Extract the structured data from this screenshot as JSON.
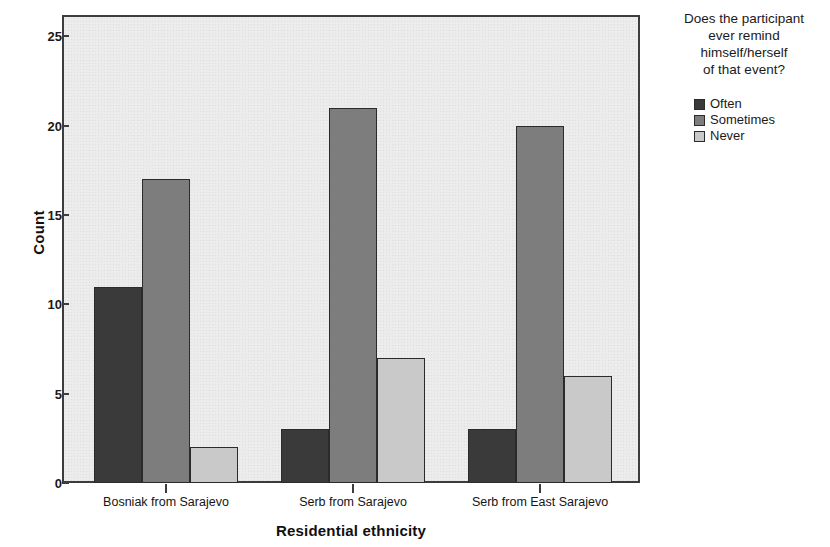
{
  "chart_data": {
    "type": "bar",
    "title": "",
    "xlabel": "Residential ethnicity",
    "ylabel": "Count",
    "categories": [
      "Bosniak from Sarajevo",
      "Serb from Sarajevo",
      "Serb from East Sarajevo"
    ],
    "series": [
      {
        "name": "Often",
        "color": "#3a3a3a",
        "values": [
          11,
          3,
          3
        ]
      },
      {
        "name": "Sometimes",
        "color": "#7d7d7d",
        "values": [
          17,
          21,
          20
        ]
      },
      {
        "name": "Never",
        "color": "#c9c9c9",
        "values": [
          2,
          7,
          6
        ]
      }
    ],
    "ylim": [
      0,
      26.2
    ],
    "yticks": [
      0,
      5,
      10,
      15,
      20,
      25
    ],
    "ytick_labels": [
      "0",
      "5",
      "10",
      "15",
      "20",
      "25"
    ],
    "grid": false,
    "legend_position": "right",
    "legend_title": "Does the participant ever remind himself/herself of that event?",
    "legend_title_lines": [
      "Does the participant",
      "ever remind",
      "himself/herself",
      "of that event?"
    ],
    "plot_background": "#ececed",
    "frame_color": "#3c3c3c",
    "bar_edge_color": "#2b2b2b"
  }
}
